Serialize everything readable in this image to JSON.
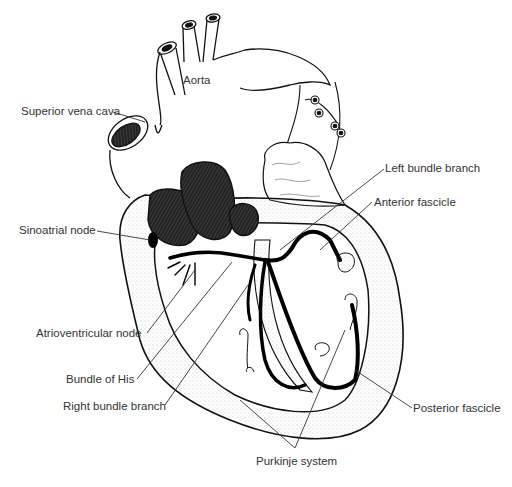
{
  "figure": {
    "colors": {
      "ink": "#111111",
      "label_text": "#333333",
      "background": "#ffffff",
      "stipple": "#9a9a9a"
    }
  },
  "labels": {
    "aorta": "Aorta",
    "superior_vena_cava": "Superior vena cava",
    "left_bundle_branch": "Left bundle branch",
    "anterior_fascicle": "Anterior fascicle",
    "sinoatrial_node": "Sinoatrial node",
    "atrioventricular_node": "Atrioventricular node",
    "bundle_of_his": "Bundle of His",
    "right_bundle_branch": "Right bundle branch",
    "posterior_fascicle": "Posterior fascicle",
    "purkinje_system": "Purkinje system"
  }
}
